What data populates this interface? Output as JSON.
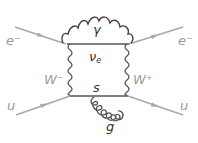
{
  "diagram": {
    "type": "feynman",
    "colors": {
      "fermion_external": "#a8a8a8",
      "boson": "#444444",
      "internal_fermion": "#555555",
      "label_external": "#9a9a9a",
      "label_internal": "#333333"
    },
    "labels": {
      "electron_in": "e⁻",
      "electron_out": "e⁻",
      "up_in": "u",
      "up_out": "u",
      "photon": "γ",
      "neutrino": "ν",
      "neutrino_sub": "e",
      "w_left": "W⁻",
      "w_right": "W⁺",
      "strange": "s",
      "gluon": "g"
    },
    "edges": [
      {
        "id": "electron-in",
        "kind": "fermion",
        "from": "e- (external)",
        "to": "v1"
      },
      {
        "id": "electron-out",
        "kind": "fermion",
        "from": "v2",
        "to": "e- (external)"
      },
      {
        "id": "up-in",
        "kind": "fermion",
        "from": "u (external)",
        "to": "v3"
      },
      {
        "id": "up-out",
        "kind": "fermion",
        "from": "v4",
        "to": "u (external)"
      },
      {
        "id": "photon",
        "kind": "photon",
        "from": "v1",
        "to": "v2",
        "label": "γ"
      },
      {
        "id": "neutrino",
        "kind": "fermion",
        "from": "v1",
        "to": "v2",
        "label": "νe"
      },
      {
        "id": "w-minus",
        "kind": "W boson",
        "from": "v1",
        "to": "v3",
        "label": "W⁻"
      },
      {
        "id": "w-plus",
        "kind": "W boson",
        "from": "v2",
        "to": "v4",
        "label": "W⁺"
      },
      {
        "id": "strange",
        "kind": "fermion",
        "from": "v3",
        "to": "v4",
        "label": "s"
      },
      {
        "id": "gluon",
        "kind": "gluon",
        "from": "v3",
        "to": "v4",
        "label": "g"
      }
    ]
  }
}
